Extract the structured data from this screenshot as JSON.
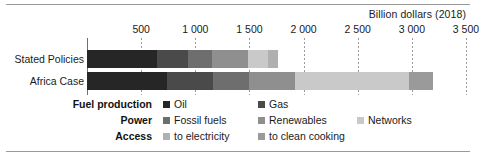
{
  "axis_title": "Billion dollars (2018)",
  "categories": [
    "Stated Policies",
    "Africa Case"
  ],
  "ticks": [
    "500",
    "1 000",
    "1 500",
    "2 000",
    "2 500",
    "3 000",
    "3 500"
  ],
  "legend": {
    "groups": [
      "Fuel production",
      "Power",
      "Access"
    ],
    "row1": [
      {
        "label": "Oil",
        "color": "#262626"
      },
      {
        "label": "Gas",
        "color": "#4a4a4a"
      }
    ],
    "row2": [
      {
        "label": "Fossil fuels",
        "color": "#6e6e6e"
      },
      {
        "label": "Renewables",
        "color": "#8f8f8f"
      },
      {
        "label": "Networks",
        "color": "#c9c9c9"
      }
    ],
    "row3": [
      {
        "label": "to electricity",
        "color": "#b0b0b0"
      },
      {
        "label": "to clean cooking",
        "color": "#9a9a9a"
      }
    ]
  },
  "chart_data": {
    "type": "bar",
    "orientation": "horizontal",
    "stacked": true,
    "title": "",
    "xlabel": "Billion dollars (2018)",
    "ylabel": "",
    "xlim": [
      0,
      3500
    ],
    "xticks": [
      500,
      1000,
      1500,
      2000,
      2500,
      3000,
      3500
    ],
    "xtick_labels": [
      "500",
      "1 000",
      "1 500",
      "2 000",
      "2 500",
      "3 000",
      "3 500"
    ],
    "grid": true,
    "legend_position": "bottom",
    "categories": [
      "Stated Policies",
      "Africa Case"
    ],
    "series": [
      {
        "name": "Oil",
        "color": "#262626",
        "values": [
          650,
          740
        ]
      },
      {
        "name": "Gas",
        "color": "#4a4a4a",
        "values": [
          280,
          420
        ]
      },
      {
        "name": "Fossil fuels",
        "color": "#6e6e6e",
        "values": [
          220,
          340
        ]
      },
      {
        "name": "Renewables",
        "color": "#8f8f8f",
        "values": [
          340,
          420
        ]
      },
      {
        "name": "Networks",
        "color": "#c9c9c9",
        "values": [
          180,
          1050
        ]
      },
      {
        "name": "to electricity",
        "color": "#b0b0b0",
        "values": [
          90,
          0
        ]
      },
      {
        "name": "to clean cooking",
        "color": "#9a9a9a",
        "values": [
          0,
          230
        ]
      }
    ],
    "totals": [
      1760,
      3200
    ]
  }
}
